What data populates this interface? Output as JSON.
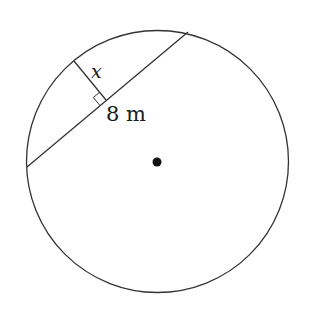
{
  "diagram": {
    "type": "circle-chord-geometry",
    "circle": {
      "cx": 157.5,
      "cy": 161.5,
      "r": 131
    },
    "center_dot": {
      "cx": 157,
      "cy": 162,
      "r": 4.5
    },
    "chord": {
      "x1": 27,
      "y1": 167,
      "x2": 188,
      "y2": 32
    },
    "perpendicular": {
      "x1": 74,
      "y1": 61,
      "x2": 106,
      "y2": 100
    },
    "labels": {
      "segment_x": "x",
      "half_chord": "8 m"
    },
    "colors": {
      "stroke": "#333333",
      "dot": "#111111",
      "text": "#1a1a1a"
    }
  }
}
